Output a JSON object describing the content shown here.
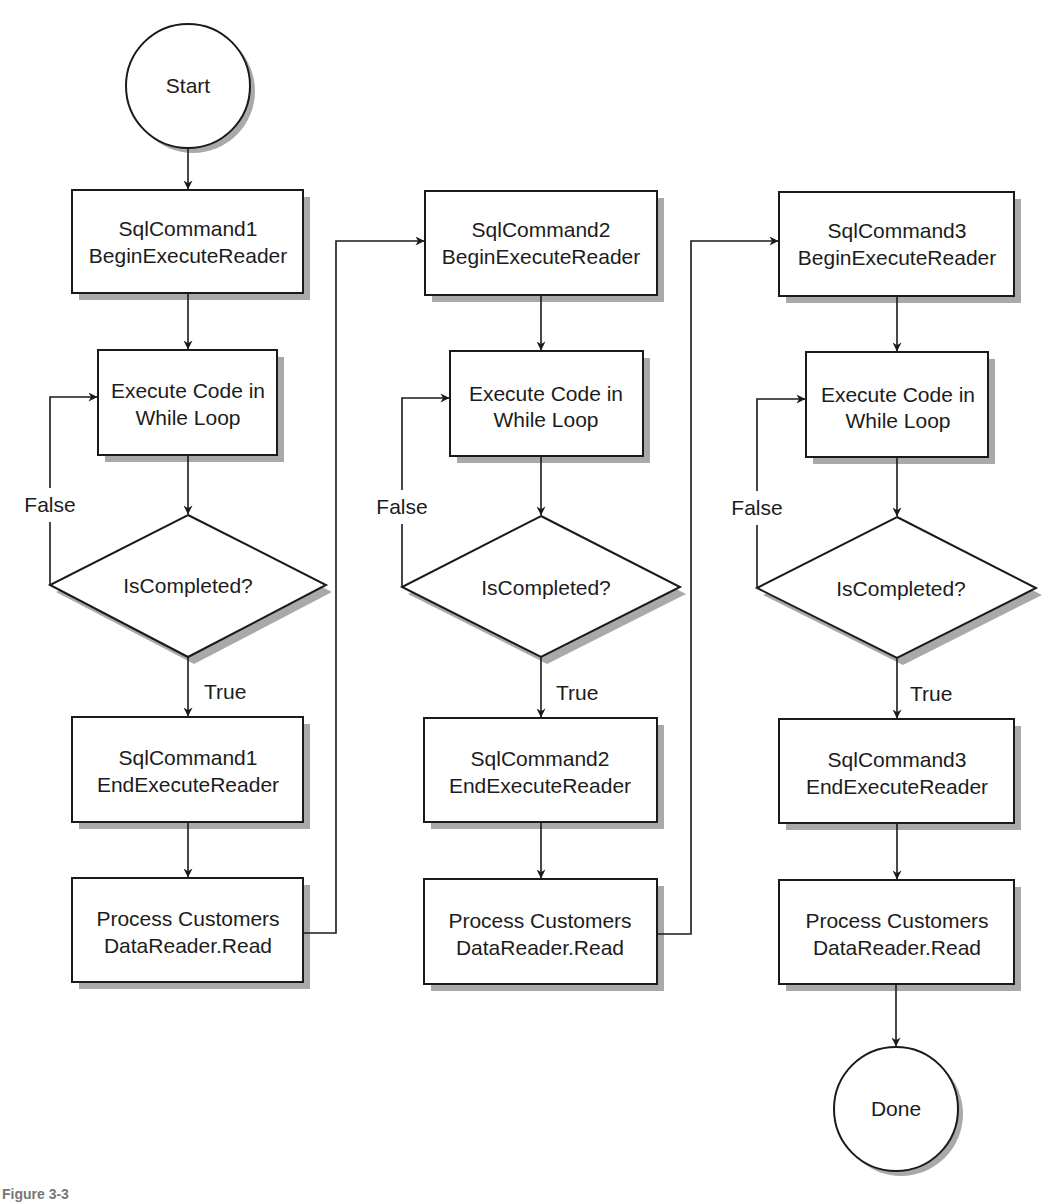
{
  "diagram": {
    "type": "flowchart",
    "start": {
      "label": "Start"
    },
    "end": {
      "label": "Done"
    },
    "columns": [
      {
        "id": "col1",
        "begin": {
          "line1": "SqlCommand1",
          "line2": "BeginExecuteReader"
        },
        "loop": {
          "line1": "Execute Code in",
          "line2": "While Loop"
        },
        "decision": {
          "label": "IsCompleted?"
        },
        "false_label": "False",
        "true_label": "True",
        "end_exec": {
          "line1": "SqlCommand1",
          "line2": "EndExecuteReader"
        },
        "process": {
          "line1": "Process Customers",
          "line2": "DataReader.Read"
        }
      },
      {
        "id": "col2",
        "begin": {
          "line1": "SqlCommand2",
          "line2": "BeginExecuteReader"
        },
        "loop": {
          "line1": "Execute Code in",
          "line2": "While Loop"
        },
        "decision": {
          "label": "IsCompleted?"
        },
        "false_label": "False",
        "true_label": "True",
        "end_exec": {
          "line1": "SqlCommand2",
          "line2": "EndExecuteReader"
        },
        "process": {
          "line1": "Process Customers",
          "line2": "DataReader.Read"
        }
      },
      {
        "id": "col3",
        "begin": {
          "line1": "SqlCommand3",
          "line2": "BeginExecuteReader"
        },
        "loop": {
          "line1": "Execute Code in",
          "line2": "While Loop"
        },
        "decision": {
          "label": "IsCompleted?"
        },
        "false_label": "False",
        "true_label": "True",
        "end_exec": {
          "line1": "SqlCommand3",
          "line2": "EndExecuteReader"
        },
        "process": {
          "line1": "Process Customers",
          "line2": "DataReader.Read"
        }
      }
    ]
  },
  "caption": "Figure 3-3",
  "colors": {
    "stroke": "#1a1a1a",
    "shadow": "#a9a9a9",
    "fill": "#ffffff"
  }
}
